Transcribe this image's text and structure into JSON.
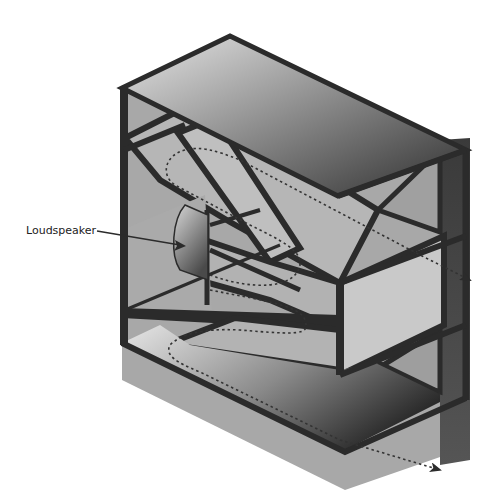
{
  "diagram": {
    "type": "folded horn loudspeaker enclosure cutaway",
    "labels": {
      "loudspeaker": "Loudspeaker"
    },
    "colors": {
      "frame": "#2b2b2b",
      "panel_light": "#c8c8c8",
      "panel_mid": "#a9a9a9",
      "panel_dark": "#3a3a3a",
      "path": "#333333",
      "background": "#ffffff"
    },
    "paths": [
      {
        "name": "upper-sound-path",
        "exit": "right-middle"
      },
      {
        "name": "lower-sound-path",
        "exit": "bottom-right"
      }
    ]
  }
}
